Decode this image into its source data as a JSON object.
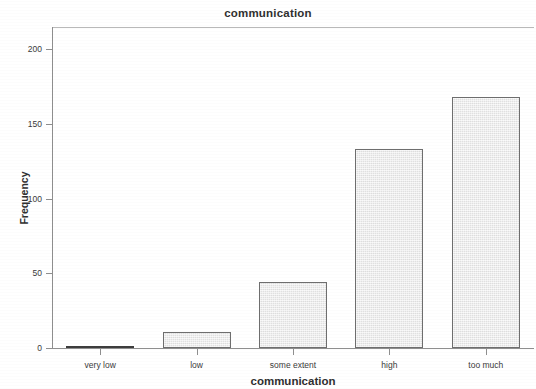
{
  "chart_data": {
    "type": "bar",
    "title": "communication",
    "xlabel": "communication",
    "ylabel": "Frequency",
    "categories": [
      "very low",
      "low",
      "some extent",
      "high",
      "too much"
    ],
    "values": [
      1,
      11,
      44,
      133,
      168
    ],
    "ylim": [
      0,
      215
    ],
    "yticks": [
      0,
      50,
      100,
      150,
      200
    ],
    "ytick_labels": [
      "0",
      "50",
      "100",
      "150",
      "200"
    ],
    "grid": false,
    "legend": "none",
    "bar_fill_color": "#e9e9e9",
    "bar_edge_color": "#6e6e6e",
    "axis_color": "#8e8e8e",
    "text_color": "#303030",
    "background_color": "#ffffff"
  }
}
